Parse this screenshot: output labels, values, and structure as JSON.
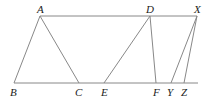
{
  "diagram": {
    "points": {
      "A": {
        "label": "A",
        "x": 40,
        "y": 16
      },
      "D": {
        "label": "D",
        "x": 150,
        "y": 16
      },
      "X": {
        "label": "X",
        "x": 197,
        "y": 16
      },
      "B": {
        "label": "B",
        "x": 14,
        "y": 83
      },
      "C": {
        "label": "C",
        "x": 79,
        "y": 83
      },
      "E": {
        "label": "E",
        "x": 104,
        "y": 83
      },
      "F": {
        "label": "F",
        "x": 156,
        "y": 83
      },
      "Y": {
        "label": "Y",
        "x": 171,
        "y": 83
      },
      "Z": {
        "label": "Z",
        "x": 184,
        "y": 83
      }
    },
    "segments": [
      [
        "A",
        "X"
      ],
      [
        "B",
        "Z"
      ],
      [
        "A",
        "B"
      ],
      [
        "A",
        "C"
      ],
      [
        "D",
        "E"
      ],
      [
        "D",
        "F"
      ],
      [
        "X",
        "Y"
      ],
      [
        "X",
        "Z"
      ]
    ]
  }
}
